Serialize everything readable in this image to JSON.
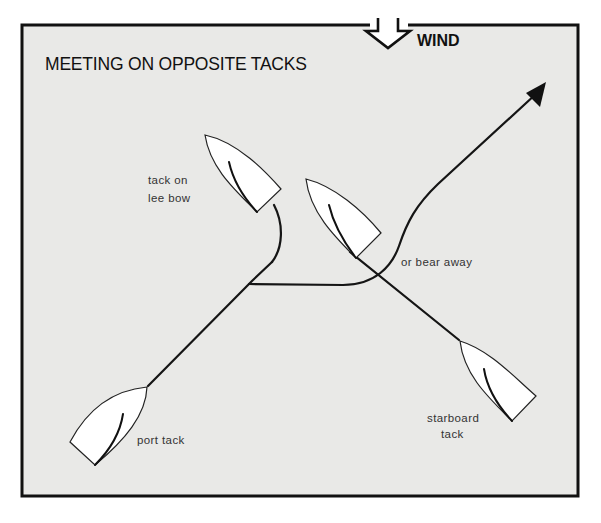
{
  "diagram": {
    "title": "MEETING ON OPPOSITE TACKS",
    "wind": {
      "label": "WIND",
      "icon": "hollow-down-arrow-icon",
      "direction": "down"
    },
    "boats": [
      {
        "id": "port-tack",
        "label": "port tack"
      },
      {
        "id": "tack-on-lee-bow",
        "label_lines": [
          "tack on",
          "lee bow"
        ]
      },
      {
        "id": "bear-away",
        "label": "or bear away"
      },
      {
        "id": "starboard-tack",
        "label_lines": [
          "starboard",
          "tack"
        ]
      }
    ],
    "colors": {
      "background": "#e9e9e7",
      "border": "#111111",
      "hull": "#ffffff",
      "line": "#151515"
    }
  }
}
